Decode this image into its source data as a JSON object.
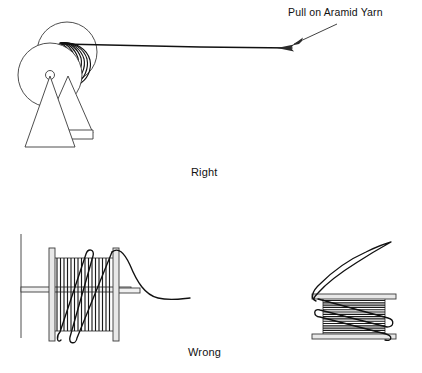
{
  "figure": {
    "title": "",
    "background_color": "#ffffff",
    "line_color": "#3a3a3a",
    "yarn_color": "#111111",
    "flange_color": "#e8e8e8",
    "width": 422,
    "height": 373
  },
  "annotations": {
    "pull_label": "Pull on Aramid Yarn"
  },
  "captions": {
    "right": "Right",
    "wrong": "Wrong"
  },
  "panels": [
    {
      "id": "right-panel",
      "caption": "Right",
      "description": "Spool on triangular stand with aramid yarn pulled off straight from the coil",
      "coil_arcs": 6
    },
    {
      "id": "wrong-panel-left",
      "caption": "Wrong",
      "description": "Side view spool with vertical windings, yarn pulled over the flange rim",
      "winding_count": 18
    },
    {
      "id": "wrong-panel-right",
      "caption": "Wrong",
      "description": "Spool with horizontal windings and yarn tail lifted off the top flange",
      "winding_count": 19
    }
  ]
}
